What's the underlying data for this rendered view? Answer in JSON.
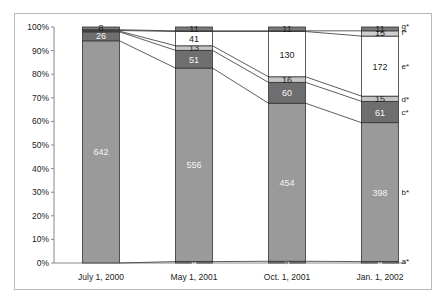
{
  "chart_data": {
    "type": "bar",
    "stacked": true,
    "normalized_percent": true,
    "title": "",
    "xlabel": "",
    "ylabel": "",
    "ylim": [
      0,
      100
    ],
    "yticks": [
      "0%",
      "10%",
      "20%",
      "30%",
      "40%",
      "50%",
      "60%",
      "70%",
      "80%",
      "90%",
      "100%"
    ],
    "categories": [
      "July 1, 2000",
      "May 1, 2001",
      "Oct. 1, 2001",
      "Jan. 1, 2002"
    ],
    "series": [
      {
        "name": "a*",
        "values": [
          0,
          4,
          5,
          4
        ],
        "color": "#8a8a8a",
        "labels": [
          "",
          "4",
          "5",
          "4"
        ]
      },
      {
        "name": "b*",
        "values": [
          642,
          556,
          454,
          398
        ],
        "color": "#9a9a9a",
        "labels": [
          "642",
          "556",
          "454",
          "398"
        ]
      },
      {
        "name": "c*",
        "values": [
          26,
          51,
          60,
          61
        ],
        "color": "#6e6e6e",
        "labels": [
          "26",
          "51",
          "60",
          "61"
        ]
      },
      {
        "name": "d*",
        "values": [
          2,
          13,
          16,
          15
        ],
        "color": "#c4c4c4",
        "labels": [
          "",
          "13",
          "16",
          "15"
        ]
      },
      {
        "name": "e*",
        "values": [
          2,
          41,
          130,
          172
        ],
        "color": "#ffffff",
        "labels": [
          "",
          "41",
          "130",
          "172"
        ]
      },
      {
        "name": "f*",
        "values": [
          2,
          2,
          2,
          15
        ],
        "color": "#d0d0d0",
        "labels": [
          "",
          "",
          "",
          "15"
        ]
      },
      {
        "name": "g*",
        "values": [
          8,
          11,
          11,
          11
        ],
        "color": "#7a7a7a",
        "labels": [
          "8",
          "11",
          "11",
          "11"
        ]
      }
    ],
    "legend_position": "right-inline",
    "grid": false,
    "connector_lines": true
  }
}
